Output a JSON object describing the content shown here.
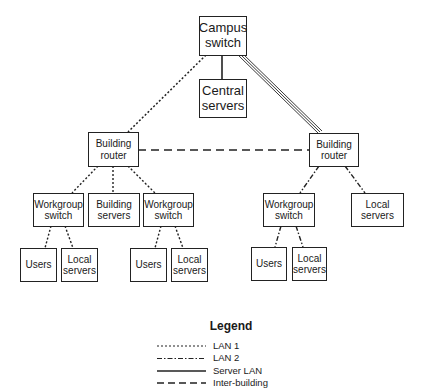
{
  "diagram": {
    "nodes": {
      "campus_switch": "Campus\nswitch",
      "central_servers": "Central\nservers",
      "building_router_left": "Building\nrouter",
      "building_router_right": "Building\nrouter",
      "workgroup_switch_1": "Workgroup\nswitch",
      "building_servers": "Building\nservers",
      "workgroup_switch_2": "Workgroup\nswitch",
      "workgroup_switch_3": "Workgroup\nswitch",
      "local_servers_right": "Local\nservers",
      "users_1": "Users",
      "local_servers_1": "Local\nservers",
      "users_2": "Users",
      "local_servers_2": "Local\nservers",
      "users_3": "Users",
      "local_servers_3": "Local\nservers"
    },
    "edges": [
      {
        "from": "campus_switch",
        "to": "central_servers",
        "type": "Server LAN"
      },
      {
        "from": "campus_switch",
        "to": "building_router_left",
        "type": "LAN 1"
      },
      {
        "from": "campus_switch",
        "to": "building_router_right",
        "type": "Server LAN (triple)"
      },
      {
        "from": "building_router_left",
        "to": "building_router_right",
        "type": "Inter-building"
      },
      {
        "from": "building_router_left",
        "to": "workgroup_switch_1",
        "type": "LAN 1"
      },
      {
        "from": "building_router_left",
        "to": "building_servers",
        "type": "LAN 1"
      },
      {
        "from": "building_router_left",
        "to": "workgroup_switch_2",
        "type": "LAN 1"
      },
      {
        "from": "workgroup_switch_1",
        "to": "users_1",
        "type": "LAN 1"
      },
      {
        "from": "workgroup_switch_1",
        "to": "local_servers_1",
        "type": "LAN 1"
      },
      {
        "from": "workgroup_switch_2",
        "to": "users_2",
        "type": "LAN 1"
      },
      {
        "from": "workgroup_switch_2",
        "to": "local_servers_2",
        "type": "LAN 1"
      },
      {
        "from": "building_router_right",
        "to": "workgroup_switch_3",
        "type": "LAN 2"
      },
      {
        "from": "building_router_right",
        "to": "local_servers_right",
        "type": "LAN 2"
      },
      {
        "from": "workgroup_switch_3",
        "to": "users_3",
        "type": "LAN 2"
      },
      {
        "from": "workgroup_switch_3",
        "to": "local_servers_3",
        "type": "LAN 2"
      }
    ]
  },
  "legend": {
    "title": "Legend",
    "items": [
      "LAN 1",
      "LAN 2",
      "Server LAN",
      "Inter-building"
    ]
  }
}
